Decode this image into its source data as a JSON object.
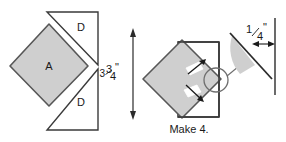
{
  "figure": {
    "caption": "Make 4.",
    "colors": {
      "piece_fill": "#cfcfcf",
      "piece_stroke": "#4a4a4a",
      "outline_stroke": "#3a3a3a",
      "text": "#1a1a1a",
      "background": "#ffffff"
    }
  },
  "left_diagram": {
    "name": "cut-pieces-layout",
    "pieces": [
      {
        "label": "A",
        "shape": "square-on-point",
        "fill": "#cfcfcf"
      },
      {
        "label": "D",
        "shape": "right-triangle",
        "fill": "#ffffff"
      },
      {
        "label": "D",
        "shape": "right-triangle",
        "fill": "#ffffff"
      }
    ],
    "dimension": {
      "whole": "3",
      "fraction_numerator": "3",
      "fraction_denominator": "4",
      "fraction": "¾",
      "unit": "\"",
      "text": "3¾\"",
      "orientation": "vertical"
    }
  },
  "right_diagram": {
    "name": "assembly-with-seam-detail",
    "pieces": [
      {
        "label": "",
        "shape": "square-on-point",
        "fill": "#cfcfcf"
      },
      {
        "label": "",
        "shape": "square-outline",
        "fill": "none"
      }
    ],
    "detail_callout": {
      "shape": "magnifier-circle",
      "wedge_fill": "#cfcfcf"
    },
    "dimension": {
      "whole": "",
      "fraction_numerator": "1",
      "fraction_denominator": "4",
      "fraction": "¼",
      "unit": "\"",
      "text": "¼\"",
      "orientation": "horizontal"
    },
    "caption": "Make 4."
  }
}
